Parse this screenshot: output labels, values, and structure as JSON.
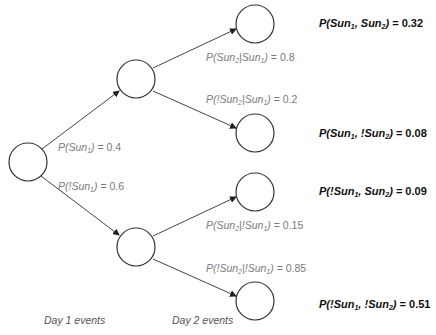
{
  "diagram": {
    "type": "probability-tree",
    "nodes": [
      {
        "id": "root",
        "cx": 28,
        "cy": 162
      },
      {
        "id": "sun1",
        "cx": 136,
        "cy": 79
      },
      {
        "id": "notsun1",
        "cx": 136,
        "cy": 247
      },
      {
        "id": "sun1_sun2",
        "cx": 255,
        "cy": 24
      },
      {
        "id": "sun1_notsun2",
        "cx": 255,
        "cy": 133
      },
      {
        "id": "notsun1_sun2",
        "cx": 255,
        "cy": 192
      },
      {
        "id": "notsun1_notsun2",
        "cx": 255,
        "cy": 301
      }
    ],
    "edges": [
      {
        "from": "root",
        "to": "sun1",
        "label": {
          "pre": "P(Sun",
          "sub": "1",
          "post": ")",
          "value": " = 0.4"
        }
      },
      {
        "from": "root",
        "to": "notsun1",
        "label": {
          "pre": "P(!Sun",
          "sub": "1",
          "post": ")",
          "value": " = 0.6"
        }
      },
      {
        "from": "sun1",
        "to": "sun1_sun2",
        "label": {
          "a": "P(Sun",
          "a_sub": "2",
          "b": "|Sun",
          "b_sub": "1",
          "c": ")",
          "value": " = 0.8"
        }
      },
      {
        "from": "sun1",
        "to": "sun1_notsun2",
        "label": {
          "a": "P(!Sun",
          "a_sub": "2",
          "b": "|Sun",
          "b_sub": "1",
          "c": ")",
          "value": " = 0.2"
        }
      },
      {
        "from": "notsun1",
        "to": "notsun1_sun2",
        "label": {
          "a": "P(Sun",
          "a_sub": "2",
          "b": "|!Sun",
          "b_sub": "1",
          "c": ")",
          "value": " = 0.15"
        }
      },
      {
        "from": "notsun1",
        "to": "notsun1_notsun2",
        "label": {
          "a": "P(!Sun",
          "a_sub": "2",
          "b": "|!Sun",
          "b_sub": "1",
          "c": ")",
          "value": " = 0.85"
        }
      }
    ],
    "joint_probabilities": [
      {
        "a": "P(Sun",
        "a_sub": "1",
        "b": ", Sun",
        "b_sub": "2",
        "c": ")",
        "value": " = 0.32"
      },
      {
        "a": "P(Sun",
        "a_sub": "1",
        "b": ", !Sun",
        "b_sub": "2",
        "c": ")",
        "value": " = 0.08"
      },
      {
        "a": "P(!Sun",
        "a_sub": "1",
        "b": ", Sun",
        "b_sub": "2",
        "c": ")",
        "value": " = 0.09"
      },
      {
        "a": "P(!Sun",
        "a_sub": "1",
        "b": ", !Sun",
        "b_sub": "2",
        "c": ")",
        "value": " = 0.51"
      }
    ],
    "axis_labels": {
      "day1": "Day 1 events",
      "day2": "Day 2 events"
    },
    "colors": {
      "stroke": "#333333",
      "edge_label": "#7a7a7a",
      "joint_label": "#111111"
    }
  }
}
